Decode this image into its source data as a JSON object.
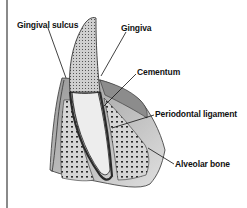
{
  "figure": {
    "labels": [
      {
        "id": "gingival-sulcus",
        "text": "Gingival sulcus"
      },
      {
        "id": "gingiva",
        "text": "Gingiva"
      },
      {
        "id": "cementum",
        "text": "Cementum"
      },
      {
        "id": "periodontal-ligament",
        "text": "Periodontal ligament"
      },
      {
        "id": "alveolar-bone",
        "text": "Alveolar bone"
      }
    ]
  },
  "colors": {
    "background": "#ffffff",
    "ink": "#111111",
    "border": "#8a8a8a",
    "bone_fill": "#cfcfcf",
    "tooth_root": "#e8e8e8",
    "enamel": "#bdbdbd"
  }
}
